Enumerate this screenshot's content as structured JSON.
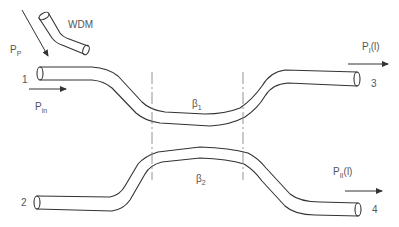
{
  "diagram": {
    "type": "directional fiber coupler with WDM pump input",
    "labels": {
      "wdm": "WDM",
      "pump_power": {
        "base": "P",
        "sub": "P"
      },
      "input_power": {
        "base": "P",
        "sub": "in"
      },
      "output_power_1": {
        "base": "P",
        "sub": "I",
        "suffix": "(l)"
      },
      "output_power_2": {
        "base": "P",
        "sub": "II",
        "suffix": "(l)"
      },
      "beta1": {
        "base": "β",
        "sub": "1"
      },
      "beta2": {
        "base": "β",
        "sub": "2"
      }
    },
    "ports": [
      {
        "id": "port-1",
        "label": "1"
      },
      {
        "id": "port-2",
        "label": "2"
      },
      {
        "id": "port-3",
        "label": "3"
      },
      {
        "id": "port-4",
        "label": "4"
      }
    ],
    "colors": {
      "line": "#333333",
      "text": "#555555",
      "dashed": "#888888",
      "background": "#ffffff"
    }
  }
}
